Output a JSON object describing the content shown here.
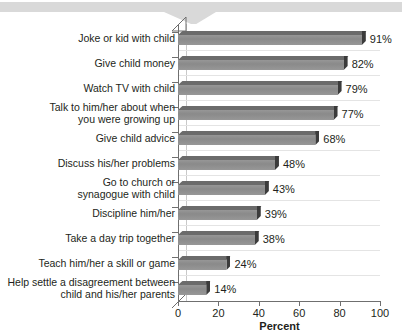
{
  "banner": {
    "name": "top-banner",
    "color": "#d9d9d9",
    "notch": "downward-tab"
  },
  "chart_data": {
    "type": "bar",
    "orientation": "horizontal",
    "title": "",
    "subtitle": "",
    "xlabel": "Percent",
    "ylabel": "",
    "xlim": [
      0,
      100
    ],
    "ylim": null,
    "grid": "horizontal-faint",
    "legend": null,
    "value_suffix": "%",
    "categories": [
      "Joke or kid with child",
      "Give child money",
      "Watch TV with child",
      "Talk to him/her about when you were growing up",
      "Give child advice",
      "Discuss his/her problems",
      "Go to church or synagogue with child",
      "Discipline him/her",
      "Take a day trip together",
      "Teach him/her a skill or game",
      "Help settle a disagreement between child and his/her parents"
    ],
    "category_lines": [
      [
        "Joke or kid with child"
      ],
      [
        "Give child money"
      ],
      [
        "Watch TV with child"
      ],
      [
        "Talk to him/her about when",
        "you were growing up"
      ],
      [
        "Give child advice"
      ],
      [
        "Discuss his/her problems"
      ],
      [
        "Go to church or",
        "synagogue with child"
      ],
      [
        "Discipline him/her"
      ],
      [
        "Take a day trip together"
      ],
      [
        "Teach him/her a skill or game"
      ],
      [
        "Help settle a disagreement between",
        "child and his/her parents"
      ]
    ],
    "values": [
      91,
      82,
      79,
      77,
      68,
      48,
      43,
      39,
      38,
      24,
      14
    ],
    "value_labels": [
      "91%",
      "82%",
      "79%",
      "77%",
      "68%",
      "48%",
      "43%",
      "39%",
      "38%",
      "24%",
      "14%"
    ],
    "xticks": [
      0,
      20,
      40,
      60,
      80,
      100
    ],
    "xtick_labels": [
      "0",
      "20",
      "40",
      "60",
      "80",
      "100"
    ],
    "colors": {
      "bar_face": "#8d8d8d",
      "bar_top": "#6b6b6b",
      "bar_side": "#3b3b3b",
      "axis": "#6f6f6f",
      "grid": "#e4e4e4",
      "text": "#231f20",
      "banner": "#d9d9d9"
    }
  }
}
